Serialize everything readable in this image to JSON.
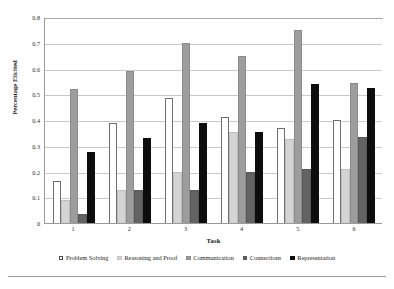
{
  "chart_data": {
    "type": "bar",
    "title": "",
    "xlabel": "Task",
    "ylabel": "Percentage Elicited",
    "categories": [
      "1",
      "2",
      "3",
      "4",
      "5",
      "6"
    ],
    "ylim": [
      0,
      0.8
    ],
    "yticks": [
      "0",
      "0.1",
      "0.2",
      "0.3",
      "0.4",
      "0.5",
      "0.6",
      "0.7",
      "0.8"
    ],
    "ytick_values": [
      0,
      0.1,
      0.2,
      0.3,
      0.4,
      0.5,
      0.6,
      0.7,
      0.8
    ],
    "grid": true,
    "legend_position": "bottom",
    "series": [
      {
        "name": "Problem Solving",
        "color": "#ffffff",
        "values": [
          0.165,
          0.39,
          0.485,
          0.41,
          0.37,
          0.4
        ]
      },
      {
        "name": "Reasoning and Proof",
        "color": "#d4d4d4",
        "values": [
          0.09,
          0.13,
          0.2,
          0.355,
          0.325,
          0.21
        ]
      },
      {
        "name": "Communication",
        "color": "#9d9d9d",
        "values": [
          0.52,
          0.592,
          0.7,
          0.648,
          0.748,
          0.545
        ]
      },
      {
        "name": "Connections",
        "color": "#636363",
        "values": [
          0.035,
          0.128,
          0.128,
          0.2,
          0.21,
          0.335
        ]
      },
      {
        "name": "Representation",
        "color": "#0d0d0d",
        "values": [
          0.277,
          0.332,
          0.389,
          0.353,
          0.54,
          0.523
        ]
      }
    ]
  }
}
